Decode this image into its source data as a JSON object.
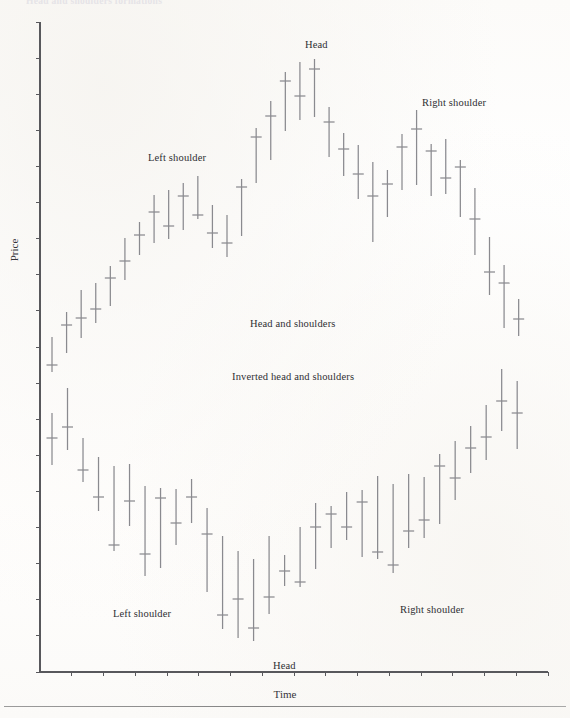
{
  "figure": {
    "cut_caption": "Head and shoulders formations",
    "xlabel": "Time",
    "ylabel": "Price"
  },
  "annotations": {
    "top_left_shoulder": "Left shoulder",
    "top_head": "Head",
    "top_right_shoulder": "Right shoulder",
    "mid_upper": "Head and shoulders",
    "mid_lower": "Inverted head and shoulders",
    "bottom_left_shoulder": "Left shoulder",
    "bottom_head": "Head",
    "bottom_right_shoulder": "Right shoulder"
  },
  "colors": {
    "bar": "#8a8a8f",
    "axis": "#58585c",
    "text": "#2f2f33",
    "paper": "#fdfdfc"
  },
  "chart_data": {
    "type": "ohlc-bar",
    "title": "Head and shoulders formations",
    "xlabel": "Time",
    "ylabel": "Price",
    "grid": false,
    "legend": null,
    "axis": {
      "x_ticks": 16,
      "y_ticks": 19,
      "x_range_px": [
        40,
        548
      ],
      "y_range_px": [
        22,
        672
      ]
    },
    "panels": [
      {
        "name": "head-and-shoulders",
        "label": "Head and shoulders",
        "bars": [
          {
            "x": 1,
            "high": 337,
            "low": 372,
            "close": 365
          },
          {
            "x": 2,
            "high": 312,
            "low": 353,
            "close": 325
          },
          {
            "x": 3,
            "high": 290,
            "low": 338,
            "close": 318
          },
          {
            "x": 4,
            "high": 283,
            "low": 323,
            "close": 309
          },
          {
            "x": 5,
            "high": 266,
            "low": 306,
            "close": 278
          },
          {
            "x": 6,
            "high": 238,
            "low": 280,
            "close": 261
          },
          {
            "x": 7,
            "high": 222,
            "low": 255,
            "close": 235
          },
          {
            "x": 8,
            "high": 195,
            "low": 243,
            "close": 212
          },
          {
            "x": 9,
            "high": 190,
            "low": 239,
            "close": 226
          },
          {
            "x": 10,
            "high": 183,
            "low": 230,
            "close": 196
          },
          {
            "x": 11,
            "high": 176,
            "low": 219,
            "close": 215
          },
          {
            "x": 12,
            "high": 205,
            "low": 248,
            "close": 233
          },
          {
            "x": 13,
            "high": 215,
            "low": 257,
            "close": 243
          },
          {
            "x": 14,
            "high": 179,
            "low": 236,
            "close": 187
          },
          {
            "x": 15,
            "high": 128,
            "low": 183,
            "close": 137
          },
          {
            "x": 16,
            "high": 101,
            "low": 160,
            "close": 116
          },
          {
            "x": 17,
            "high": 72,
            "low": 131,
            "close": 81
          },
          {
            "x": 18,
            "high": 62,
            "low": 120,
            "close": 96
          },
          {
            "x": 19,
            "high": 59,
            "low": 117,
            "close": 69
          },
          {
            "x": 20,
            "high": 107,
            "low": 157,
            "close": 122
          },
          {
            "x": 21,
            "high": 133,
            "low": 176,
            "close": 149
          },
          {
            "x": 22,
            "high": 145,
            "low": 199,
            "close": 174
          },
          {
            "x": 23,
            "high": 162,
            "low": 242,
            "close": 196
          },
          {
            "x": 24,
            "high": 170,
            "low": 217,
            "close": 184
          },
          {
            "x": 25,
            "high": 134,
            "low": 190,
            "close": 147
          },
          {
            "x": 26,
            "high": 110,
            "low": 185,
            "close": 129
          },
          {
            "x": 27,
            "high": 144,
            "low": 196,
            "close": 151
          },
          {
            "x": 28,
            "high": 139,
            "low": 194,
            "close": 178
          },
          {
            "x": 29,
            "high": 160,
            "low": 217,
            "close": 167
          },
          {
            "x": 30,
            "high": 188,
            "low": 255,
            "close": 219
          },
          {
            "x": 31,
            "high": 237,
            "low": 295,
            "close": 272
          },
          {
            "x": 32,
            "high": 265,
            "low": 328,
            "close": 283
          },
          {
            "x": 33,
            "high": 299,
            "low": 336,
            "close": 319
          }
        ]
      },
      {
        "name": "inverted-head-and-shoulders",
        "label": "Inverted head and shoulders",
        "bars": [
          {
            "x": 1,
            "high": 413,
            "low": 465,
            "close": 438
          },
          {
            "x": 2,
            "high": 388,
            "low": 450,
            "close": 427
          },
          {
            "x": 3,
            "high": 438,
            "low": 482,
            "close": 470
          },
          {
            "x": 4,
            "high": 457,
            "low": 511,
            "close": 497
          },
          {
            "x": 5,
            "high": 466,
            "low": 551,
            "close": 545
          },
          {
            "x": 6,
            "high": 464,
            "low": 526,
            "close": 501
          },
          {
            "x": 7,
            "high": 486,
            "low": 576,
            "close": 554
          },
          {
            "x": 8,
            "high": 488,
            "low": 568,
            "close": 498
          },
          {
            "x": 9,
            "high": 489,
            "low": 545,
            "close": 523
          },
          {
            "x": 10,
            "high": 479,
            "low": 523,
            "close": 497
          },
          {
            "x": 11,
            "high": 508,
            "low": 592,
            "close": 534
          },
          {
            "x": 12,
            "high": 536,
            "low": 629,
            "close": 615
          },
          {
            "x": 13,
            "high": 551,
            "low": 638,
            "close": 599
          },
          {
            "x": 14,
            "high": 559,
            "low": 641,
            "close": 628
          },
          {
            "x": 15,
            "high": 536,
            "low": 614,
            "close": 597
          },
          {
            "x": 16,
            "high": 555,
            "low": 586,
            "close": 571
          },
          {
            "x": 17,
            "high": 527,
            "low": 587,
            "close": 582
          },
          {
            "x": 18,
            "high": 503,
            "low": 569,
            "close": 527
          },
          {
            "x": 19,
            "high": 506,
            "low": 548,
            "close": 514
          },
          {
            "x": 20,
            "high": 492,
            "low": 540,
            "close": 527
          },
          {
            "x": 21,
            "high": 490,
            "low": 557,
            "close": 502
          },
          {
            "x": 22,
            "high": 476,
            "low": 559,
            "close": 552
          },
          {
            "x": 23,
            "high": 484,
            "low": 573,
            "close": 565
          },
          {
            "x": 24,
            "high": 474,
            "low": 548,
            "close": 531
          },
          {
            "x": 25,
            "high": 477,
            "low": 538,
            "close": 520
          },
          {
            "x": 26,
            "high": 454,
            "low": 524,
            "close": 466
          },
          {
            "x": 27,
            "high": 441,
            "low": 500,
            "close": 478
          },
          {
            "x": 28,
            "high": 426,
            "low": 473,
            "close": 448
          },
          {
            "x": 29,
            "high": 405,
            "low": 460,
            "close": 437
          },
          {
            "x": 30,
            "high": 369,
            "low": 431,
            "close": 401
          },
          {
            "x": 31,
            "high": 381,
            "low": 449,
            "close": 413
          }
        ]
      }
    ],
    "annotations": [
      {
        "text": "Left shoulder",
        "x": 148,
        "y": 152,
        "panel": "head-and-shoulders"
      },
      {
        "text": "Head",
        "x": 305,
        "y": 39,
        "panel": "head-and-shoulders"
      },
      {
        "text": "Right shoulder",
        "x": 422,
        "y": 97,
        "panel": "head-and-shoulders"
      },
      {
        "text": "Head and shoulders",
        "x": 250,
        "y": 318,
        "panel": "head-and-shoulders"
      },
      {
        "text": "Inverted head and shoulders",
        "x": 232,
        "y": 371,
        "panel": "inverted-head-and-shoulders"
      },
      {
        "text": "Left shoulder",
        "x": 113,
        "y": 608,
        "panel": "inverted-head-and-shoulders"
      },
      {
        "text": "Head",
        "x": 273,
        "y": 660,
        "panel": "inverted-head-and-shoulders"
      },
      {
        "text": "Right shoulder",
        "x": 400,
        "y": 604,
        "panel": "inverted-head-and-shoulders"
      }
    ]
  }
}
